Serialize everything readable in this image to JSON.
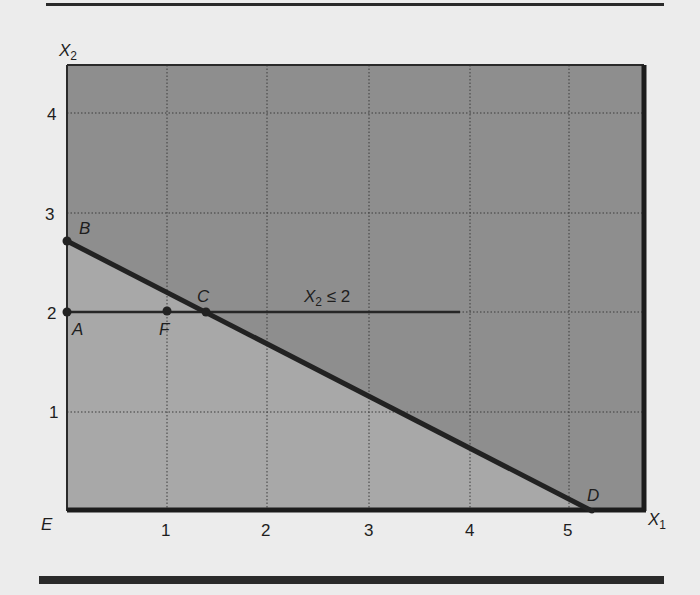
{
  "figure": {
    "axes": {
      "x_label": "X",
      "x_label_sub": "1",
      "y_label": "X",
      "y_label_sub": "2",
      "origin_label": "E",
      "x_ticks": [
        "1",
        "2",
        "3",
        "4",
        "5"
      ],
      "y_ticks": [
        "1",
        "2",
        "3",
        "4"
      ],
      "x_range": [
        0,
        5.75
      ],
      "y_range": [
        0,
        4.5
      ]
    },
    "constraint_label": {
      "var": "X",
      "sub": "2",
      "rest": " ≤ 2"
    },
    "points": [
      {
        "name": "A",
        "x": 0,
        "y": 2
      },
      {
        "name": "B",
        "x": 0,
        "y": 2.7
      },
      {
        "name": "C",
        "x": 1.4,
        "y": 2
      },
      {
        "name": "D",
        "x": 5.25,
        "y": 0
      },
      {
        "name": "E",
        "x": 0,
        "y": 0
      },
      {
        "name": "F",
        "x": 1,
        "y": 2
      }
    ],
    "lines": [
      {
        "name": "objective-line-BD",
        "from": [
          0,
          2.7
        ],
        "to": [
          5.25,
          0
        ]
      },
      {
        "name": "constraint-line-x2-le-2",
        "from": [
          0,
          2
        ],
        "to": [
          3.9,
          2
        ]
      }
    ],
    "colors": {
      "background": "#ececec",
      "region_dark": "#8f8f8f",
      "region_light": "#a9a9a9",
      "line": "#262626",
      "grid": "#4a4a4a"
    }
  }
}
